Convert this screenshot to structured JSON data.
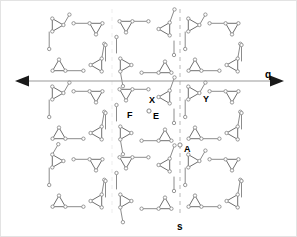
{
  "figure": {
    "kind": "crystallographic-symmetry-diagram",
    "background_color": "#ffffff",
    "border_color": "#e3e3e3",
    "width": 297,
    "height": 237
  },
  "axes": {
    "horizontal": {
      "label": "q",
      "label_x": 264,
      "label_y": 69,
      "y": 80,
      "x_start": 14,
      "x_end": 283,
      "color": "#9a9a9a",
      "arrow_color": "#1a1a1a",
      "double_headed": true
    },
    "vertical_dashed": {
      "label": "s",
      "label_x": 176,
      "label_y": 221,
      "x": 179,
      "y_start": 8,
      "y_end": 214,
      "color": "#b9b9b9",
      "dashed": true
    },
    "secondary_dashed": {
      "x": 111,
      "y_start": 8,
      "y_end": 214,
      "color": "#ededed",
      "dashed": true
    }
  },
  "point_labels": [
    {
      "id": "X",
      "text": "X",
      "x": 148,
      "y": 95,
      "size": 9
    },
    {
      "id": "Y",
      "text": "Y",
      "x": 202,
      "y": 94,
      "size": 9
    },
    {
      "id": "F",
      "text": "F",
      "x": 126,
      "y": 110,
      "size": 9
    },
    {
      "id": "E",
      "text": "E",
      "x": 152,
      "y": 111,
      "size": 9
    },
    {
      "id": "A",
      "text": "A",
      "x": 183,
      "y": 144,
      "size": 9
    }
  ],
  "motif": {
    "node_fill": "#ffffff",
    "node_stroke": "#8c8c8c",
    "node_radius": 1.7,
    "edge_color": "#8c8c8c",
    "edge_width": 1.0,
    "triangle_stroke": "#6f6f6f",
    "description": "four triangular trimer motifs per unit cell, one per corner, connected by tether links"
  },
  "lattice": {
    "columns": 3,
    "rows": 3,
    "cell_width": 68,
    "cell_height": 68,
    "origin_x": 43,
    "origin_y": 12,
    "column_variants": [
      "A",
      "B",
      "A"
    ],
    "row_variants": [
      "A",
      "A",
      "A"
    ]
  },
  "chart_data": {
    "type": "scatter",
    "title": "",
    "xlabel": "q",
    "ylabel": "s",
    "legend": [],
    "annotations": [
      "X",
      "Y",
      "F",
      "E",
      "A",
      "q",
      "s"
    ],
    "grid": false
  }
}
